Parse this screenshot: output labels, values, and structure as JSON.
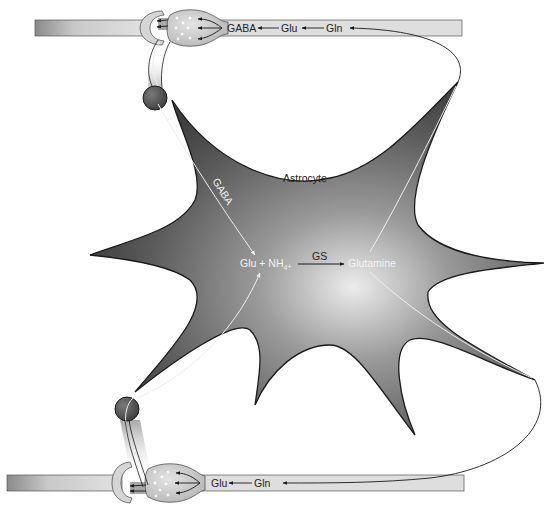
{
  "diagram": {
    "colors": {
      "axon_light": "#dcdcdc",
      "axon_dark": "#8a8a8a",
      "astrocyte_center": "#e6e6e6",
      "astrocyte_edge": "#4a4a4a",
      "outline": "#1a1a1a",
      "arrow_dark": "#1a1a1a",
      "arrow_light": "#e8e8e8"
    },
    "top_neuron": {
      "labels": {
        "gaba": "GABA",
        "glu": "Glu",
        "gln": "Gln"
      }
    },
    "bottom_neuron": {
      "labels": {
        "glu": "Glu",
        "gln": "Gln"
      }
    },
    "astrocyte": {
      "label": "Astrocyte",
      "gaba_uptake_label": "GABA",
      "reaction": {
        "substrate": "Glu + NH",
        "subscript": "4",
        "charge": "+",
        "enzyme": "GS",
        "product": "Glutamine"
      }
    }
  }
}
